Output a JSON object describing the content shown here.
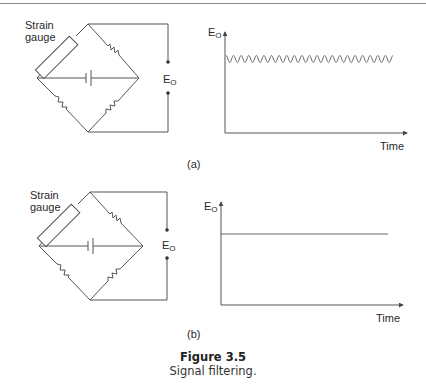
{
  "figure": {
    "number_label": "Figure 3.5",
    "caption": "Signal filtering."
  },
  "panels": [
    {
      "id": "a",
      "label": "(a)",
      "circuit": {
        "strain_gauge_label_line1": "Strain",
        "strain_gauge_label_line2": "gauge",
        "output_label": "E",
        "output_subscript": "O",
        "components": [
          "strain-gauge",
          "resistor",
          "resistor",
          "resistor",
          "battery",
          "output-terminal-top",
          "output-terminal-bottom"
        ]
      },
      "graph": {
        "y_label": "E",
        "y_subscript": "O",
        "x_label": "Time",
        "signal": "sinusoidal ripple around constant level",
        "cycles": 22
      }
    },
    {
      "id": "b",
      "label": "(b)",
      "circuit": {
        "strain_gauge_label_line1": "Strain",
        "strain_gauge_label_line2": "gauge",
        "output_label": "E",
        "output_subscript": "O",
        "components": [
          "strain-gauge",
          "resistor",
          "resistor",
          "resistor",
          "battery",
          "output-terminal-top",
          "output-terminal-bottom"
        ]
      },
      "graph": {
        "y_label": "E",
        "y_subscript": "O",
        "x_label": "Time",
        "signal": "constant flat level (filtered)"
      }
    }
  ],
  "colors": {
    "line": "#555555",
    "text": "#222222",
    "rule": "#8a8a8a"
  }
}
